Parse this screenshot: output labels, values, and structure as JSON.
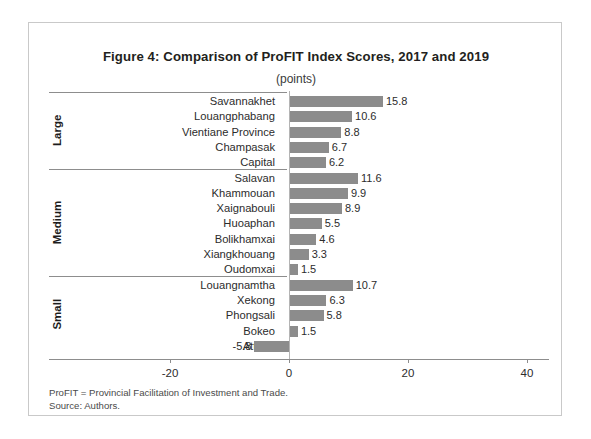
{
  "figure": {
    "title": "Figure 4: Comparison of ProFIT Index Scores, 2017 and 2019",
    "subtitle": "(points)"
  },
  "footnotes": {
    "definition": "ProFIT = Provincial Facilitation of Investment and Trade.",
    "source": "Source: Authors."
  },
  "groups": [
    {
      "name": "Large"
    },
    {
      "name": "Medium"
    },
    {
      "name": "Small"
    }
  ],
  "chart_data": {
    "type": "bar",
    "orientation": "horizontal",
    "title": "Figure 4: Comparison of ProFIT Index Scores, 2017 and 2019",
    "subtitle": "(points)",
    "xlabel": "",
    "ylabel": "",
    "xlim": [
      -20,
      40
    ],
    "xticks": [
      -20,
      0,
      20,
      40
    ],
    "xtick_labels": [
      "-20",
      "0",
      "20",
      "40"
    ],
    "grid": false,
    "legend": false,
    "bar_color": "#8c8c8c",
    "categories": [
      "Savannakhet",
      "Louangphabang",
      "Vientiane Province",
      "Champasak",
      "Capital",
      "Salavan",
      "Khammouan",
      "Xaignabouli",
      "Huoaphan",
      "Bolikhamxai",
      "Xiangkhouang",
      "Oudomxai",
      "Louangnamtha",
      "Xekong",
      "Phongsali",
      "Bokeo",
      "Attapu"
    ],
    "values": [
      15.8,
      10.6,
      8.8,
      6.7,
      6.2,
      11.6,
      9.9,
      8.9,
      5.5,
      4.6,
      3.3,
      1.5,
      10.7,
      6.3,
      5.8,
      1.5,
      -5.8
    ],
    "value_labels": [
      "15.8",
      "10.6",
      "8.8",
      "6.7",
      "6.2",
      "11.6",
      "9.9",
      "8.9",
      "5.5",
      "4.6",
      "3.3",
      "1.5",
      "10.7",
      "6.3",
      "5.8",
      "1.5",
      "-5.8"
    ],
    "group_assignment": [
      "Large",
      "Large",
      "Large",
      "Large",
      "Large",
      "Medium",
      "Medium",
      "Medium",
      "Medium",
      "Medium",
      "Medium",
      "Medium",
      "Small",
      "Small",
      "Small",
      "Small",
      "Small"
    ]
  }
}
